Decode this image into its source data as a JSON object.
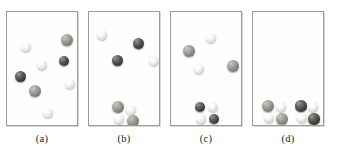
{
  "figure": {
    "title": "",
    "background_color": "#ffffff",
    "panel_border_color": "#9a9a9a",
    "atom_colors": {
      "light": "#f0efeb",
      "gray": "#8b8983",
      "dark": "#2c2b27"
    }
  },
  "chart_data": {
    "type": "diagram",
    "title": "",
    "xlabel": "",
    "ylabel": "",
    "panels": [
      {
        "caption": "(a)",
        "box": {
          "x": 6,
          "y": 11,
          "w": 72,
          "h": 115
        },
        "light_count": 4,
        "gray_count": 2,
        "dark_count": 2,
        "cluster_count": 0,
        "atoms": [
          {
            "cx": 19,
            "cy": 35,
            "r": 5.0,
            "shade": "light"
          },
          {
            "cx": 60,
            "cy": 28,
            "r": 6.0,
            "shade": "gray"
          },
          {
            "cx": 35,
            "cy": 53,
            "r": 5.2,
            "shade": "light"
          },
          {
            "cx": 57,
            "cy": 49,
            "r": 5.0,
            "shade": "dark"
          },
          {
            "cx": 13,
            "cy": 64,
            "r": 5.5,
            "shade": "dark"
          },
          {
            "cx": 63,
            "cy": 72,
            "r": 4.8,
            "shade": "light"
          },
          {
            "cx": 28,
            "cy": 79,
            "r": 6.4,
            "shade": "gray"
          },
          {
            "cx": 41,
            "cy": 101,
            "r": 4.8,
            "shade": "light"
          }
        ]
      },
      {
        "caption": "(b)",
        "box": {
          "x": 88,
          "y": 11,
          "w": 72,
          "h": 115
        },
        "light_count": 2,
        "gray_count": 0,
        "dark_count": 2,
        "cluster_count": 1,
        "atoms": [
          {
            "cx": 13,
            "cy": 23,
            "r": 5.0,
            "shade": "light"
          },
          {
            "cx": 49,
            "cy": 31,
            "r": 5.5,
            "shade": "dark"
          },
          {
            "cx": 28,
            "cy": 48,
            "r": 5.5,
            "shade": "dark"
          },
          {
            "cx": 65,
            "cy": 49,
            "r": 5.0,
            "shade": "light"
          },
          {
            "cx": 29,
            "cy": 95,
            "r": 6.0,
            "shade": "gray"
          },
          {
            "cx": 42,
            "cy": 98,
            "r": 4.8,
            "shade": "light"
          },
          {
            "cx": 30,
            "cy": 107,
            "r": 4.8,
            "shade": "light"
          },
          {
            "cx": 44,
            "cy": 109,
            "r": 6.0,
            "shade": "gray"
          }
        ]
      },
      {
        "caption": "(c)",
        "box": {
          "x": 170,
          "y": 11,
          "w": 72,
          "h": 115
        },
        "light_count": 2,
        "gray_count": 2,
        "dark_count": 2,
        "cluster_count": 1,
        "atoms": [
          {
            "cx": 18,
            "cy": 39,
            "r": 6.2,
            "shade": "gray"
          },
          {
            "cx": 40,
            "cy": 26,
            "r": 4.8,
            "shade": "light"
          },
          {
            "cx": 28,
            "cy": 57,
            "r": 4.8,
            "shade": "light"
          },
          {
            "cx": 62,
            "cy": 54,
            "r": 6.0,
            "shade": "gray"
          },
          {
            "cx": 29,
            "cy": 95,
            "r": 5.3,
            "shade": "dark"
          },
          {
            "cx": 42,
            "cy": 95,
            "r": 5.3,
            "shade": "light"
          },
          {
            "cx": 30,
            "cy": 107,
            "r": 5.3,
            "shade": "light"
          },
          {
            "cx": 43,
            "cy": 107,
            "r": 5.3,
            "shade": "dark"
          }
        ]
      },
      {
        "caption": "(d)",
        "box": {
          "x": 252,
          "y": 11,
          "w": 72,
          "h": 115
        },
        "light_count": 0,
        "gray_count": 0,
        "dark_count": 0,
        "cluster_count": 2,
        "atoms": [
          {
            "cx": 15,
            "cy": 94,
            "r": 6.0,
            "shade": "gray"
          },
          {
            "cx": 28,
            "cy": 95,
            "r": 4.9,
            "shade": "light"
          },
          {
            "cx": 16,
            "cy": 106,
            "r": 4.9,
            "shade": "light"
          },
          {
            "cx": 29,
            "cy": 107,
            "r": 6.0,
            "shade": "gray"
          },
          {
            "cx": 48,
            "cy": 94,
            "r": 5.6,
            "shade": "dark"
          },
          {
            "cx": 60,
            "cy": 95,
            "r": 4.9,
            "shade": "light"
          },
          {
            "cx": 49,
            "cy": 106,
            "r": 4.9,
            "shade": "light"
          },
          {
            "cx": 61,
            "cy": 107,
            "r": 5.6,
            "shade": "dark"
          }
        ]
      }
    ]
  }
}
